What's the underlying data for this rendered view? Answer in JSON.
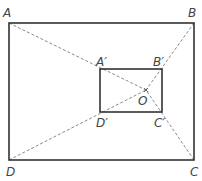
{
  "diagram": {
    "title": "",
    "outer_rect": {
      "vertices": {
        "A": [
          9,
          23
        ],
        "B": [
          194,
          23
        ],
        "C": [
          194,
          160
        ],
        "D": [
          9,
          160
        ]
      }
    },
    "inner_rect": {
      "vertices": {
        "A'": [
          100,
          69
        ],
        "B'": [
          162,
          69
        ],
        "C'": [
          162,
          112
        ],
        "D'": [
          100,
          112
        ]
      }
    },
    "center": {
      "label": "O",
      "point": [
        146,
        90
      ]
    },
    "labels": {
      "A": "A",
      "B": "B",
      "C": "C",
      "D": "D",
      "A_prime": "A′",
      "B_prime": "B′",
      "C_prime": "C′",
      "D_prime": "D′",
      "O": "O"
    },
    "colors": {
      "solid": "#333333",
      "dashed": "#888888"
    }
  }
}
